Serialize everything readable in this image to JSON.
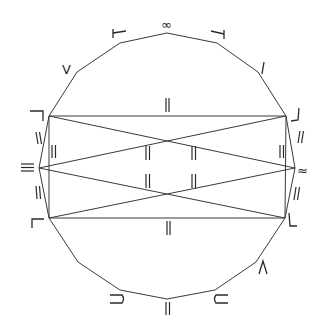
{
  "diagram": {
    "type": "polygon-with-inscribed-rectangle",
    "stroke_color": "#3a3a3a",
    "background": "#ffffff",
    "vertices": {
      "top": [
        167,
        33
      ],
      "top_left_1": [
        120,
        43
      ],
      "top_right_1": [
        217,
        43
      ],
      "top_left_2": [
        77,
        72
      ],
      "top_right_2": [
        258,
        72
      ],
      "rect_tl": [
        49,
        116
      ],
      "rect_tr": [
        286,
        116
      ],
      "mid_left": [
        39,
        168
      ],
      "mid_right": [
        295,
        168
      ],
      "rect_bl": [
        49,
        218
      ],
      "rect_br": [
        285,
        218
      ],
      "bottom_left_2": [
        78,
        262
      ],
      "bottom_right_2": [
        256,
        262
      ],
      "bottom_left_1": [
        120,
        290
      ],
      "bottom_right_1": [
        215,
        290
      ],
      "bottom": [
        167,
        299
      ]
    },
    "marks": {
      "top": "∞",
      "top_left_edge": "⊢",
      "top_right_edge": "⊣",
      "left_upper_edge": "V",
      "right_upper_edge": "I",
      "rect_top": "||",
      "rect_bottom": "||",
      "corner_tl": "⌐",
      "corner_tr": "⌟",
      "corner_bl": "⌞",
      "corner_br": "L",
      "mid_left": "≡",
      "mid_right": "≈",
      "left_side_upper": "||",
      "left_side_lower": "||",
      "right_side_upper": "//",
      "right_side_lower": "//",
      "inner_left": "||",
      "inner_right": "||",
      "center_upper_left": "||",
      "center_upper_right": "||",
      "center_lower_left": "||",
      "center_lower_right": "||",
      "bottom_left_edge": "⊃",
      "bottom_right_edge": "⊂",
      "bottom": "||",
      "right_lower_edge": "Λ"
    }
  }
}
